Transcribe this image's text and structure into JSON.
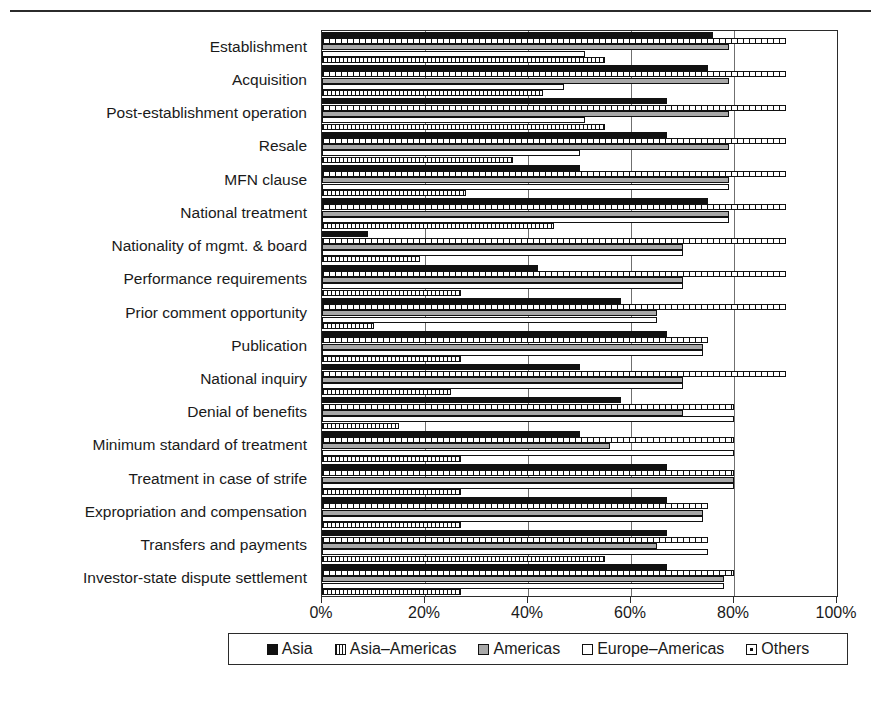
{
  "chart_data": {
    "type": "bar",
    "orientation": "horizontal",
    "title": "",
    "xlabel": "",
    "ylabel": "",
    "xlim": [
      0,
      100
    ],
    "xticks": [
      "0%",
      "20%",
      "40%",
      "60%",
      "80%",
      "100%"
    ],
    "xtick_values": [
      0,
      20,
      40,
      60,
      80,
      100
    ],
    "grid": true,
    "legend_position": "bottom",
    "categories": [
      "Establishment",
      "Acquisition",
      "Post-establishment operation",
      "Resale",
      "MFN clause",
      "National treatment",
      "Nationality of mgmt. & board",
      "Performance requirements",
      "Prior comment opportunity",
      "Publication",
      "National inquiry",
      "Denial of benefits",
      "Minimum standard of treatment",
      "Treatment in case of strife",
      "Expropriation and compensation",
      "Transfers and payments",
      "Investor-state dispute settlement"
    ],
    "series": [
      {
        "name": "Asia",
        "color": "#111111",
        "pattern": "solid-black",
        "values": [
          76,
          75,
          67,
          67,
          50,
          75,
          9,
          42,
          58,
          67,
          50,
          58,
          50,
          67,
          67,
          67,
          67
        ]
      },
      {
        "name": "Asia-Americas",
        "color": "#ffffff",
        "pattern": "dashed-hatch",
        "values": [
          90,
          90,
          90,
          90,
          90,
          90,
          90,
          90,
          90,
          75,
          90,
          80,
          80,
          80,
          75,
          75,
          80
        ]
      },
      {
        "name": "Americas",
        "color": "#a8a8a8",
        "pattern": "solid-gray",
        "values": [
          79,
          79,
          79,
          79,
          79,
          79,
          70,
          70,
          65,
          74,
          70,
          70,
          56,
          80,
          74,
          65,
          78
        ]
      },
      {
        "name": "Europe-Americas",
        "color": "#ffffff",
        "pattern": "solid-white",
        "values": [
          51,
          47,
          51,
          50,
          79,
          79,
          70,
          70,
          65,
          74,
          70,
          80,
          80,
          80,
          74,
          75,
          78
        ]
      },
      {
        "name": "Others",
        "color": "#ffffff",
        "pattern": "dotted",
        "values": [
          55,
          43,
          55,
          37,
          28,
          45,
          19,
          27,
          10,
          27,
          25,
          15,
          27,
          27,
          27,
          55,
          27
        ]
      }
    ]
  },
  "legend": {
    "entries": [
      {
        "label": "Asia",
        "swatch": "s-asia"
      },
      {
        "label": "Asia–Americas",
        "swatch": "s-asia-americas"
      },
      {
        "label": "Americas",
        "swatch": "s-americas"
      },
      {
        "label": "Europe–Americas",
        "swatch": "s-europe-americas"
      },
      {
        "label": "Others",
        "swatch": "s-others"
      }
    ]
  }
}
